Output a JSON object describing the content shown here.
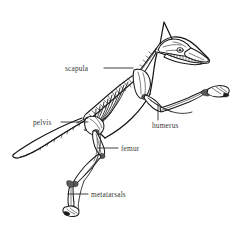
{
  "figure": {
    "background_color": "#ffffff",
    "line_color": "#1a1a1a",
    "label_color": "#3a3a3a"
  },
  "labels": [
    {
      "id": "scapula",
      "text": "scapula",
      "text_x": 65,
      "text_y": 71,
      "anchor": "start",
      "leader": "M 104 68 L 133 68",
      "part": "shoulder-blade"
    },
    {
      "id": "pelvis",
      "text": "pelvis",
      "text_x": 33,
      "text_y": 125,
      "anchor": "start",
      "leader": "M 61 122 L 88 122",
      "part": "hip-bone"
    },
    {
      "id": "humerus",
      "text": "humerus",
      "text_x": 152,
      "text_y": 128,
      "anchor": "start",
      "leader": "M 158 104 L 158 120",
      "part": "upper-foreleg-bone"
    },
    {
      "id": "femur",
      "text": "femur",
      "text_x": 121,
      "text_y": 151,
      "anchor": "start",
      "leader": "M 98 148 L 118 148",
      "part": "thigh-bone"
    },
    {
      "id": "metatarsals",
      "text": "metatarsals",
      "text_x": 91,
      "text_y": 197,
      "anchor": "start",
      "leader": "M 68 194 L 88 194",
      "part": "hind-foot-bones"
    }
  ]
}
